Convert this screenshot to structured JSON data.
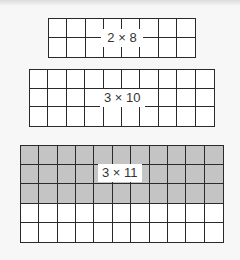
{
  "diagram": {
    "background": "#f7f7f7",
    "line_color": "#2a2a2a",
    "shade_color": "#c4c4c4",
    "arrays": [
      {
        "id": "array-2x8",
        "label": "2 × 8",
        "rows": 2,
        "cols": 8,
        "shaded_rows": 0,
        "box": {
          "x": 48,
          "y": 18,
          "w": 148,
          "h": 40
        },
        "label_box": {
          "x": 101,
          "y": 29,
          "w": 42
        }
      },
      {
        "id": "array-3x10",
        "label": "3 × 10",
        "rows": 3,
        "cols": 10,
        "shaded_rows": 0,
        "box": {
          "x": 29,
          "y": 69,
          "w": 186,
          "h": 58
        },
        "label_box": {
          "x": 100,
          "y": 89,
          "w": 44
        }
      },
      {
        "id": "array-3x11-of-5x11",
        "label": "3 × 11",
        "rows": 5,
        "cols": 11,
        "shaded_rows": 3,
        "box": {
          "x": 20,
          "y": 145,
          "w": 204,
          "h": 98
        },
        "label_box": {
          "x": 98,
          "y": 164,
          "w": 38
        }
      }
    ]
  }
}
